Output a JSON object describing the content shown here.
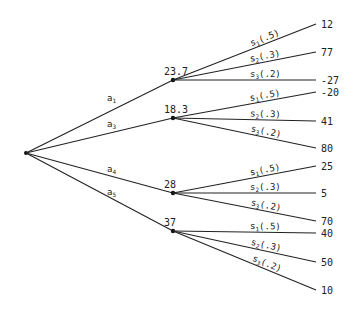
{
  "root": {
    "x": 26,
    "y": 153
  },
  "actions": [
    {
      "label": "a",
      "sub": "1",
      "value": "23.7",
      "node": {
        "x": 173,
        "y": 80
      },
      "label_pos": {
        "x": 107,
        "y": 101
      },
      "outcomes": [
        {
          "state": "s",
          "sub": "1",
          "prob": "(.5)",
          "payoff": "12",
          "y": 24
        },
        {
          "state": "s",
          "sub": "2",
          "prob": "(.3)",
          "payoff": "77",
          "y": 52
        },
        {
          "state": "s",
          "sub": "3",
          "prob": "(.2)",
          "payoff": "-27",
          "y": 80
        }
      ]
    },
    {
      "label": "a",
      "sub": "3",
      "value": "18.3",
      "node": {
        "x": 173,
        "y": 118
      },
      "label_pos": {
        "x": 107,
        "y": 127
      },
      "outcomes": [
        {
          "state": "s",
          "sub": "1",
          "prob": "(.5)",
          "payoff": "-20",
          "y": 92
        },
        {
          "state": "s",
          "sub": "2",
          "prob": "(.3)",
          "payoff": "41",
          "y": 121
        },
        {
          "state": "s",
          "sub": "3",
          "prob": "(.2)",
          "payoff": "80",
          "y": 148
        }
      ]
    },
    {
      "label": "a",
      "sub": "4",
      "value": "28",
      "node": {
        "x": 173,
        "y": 193
      },
      "label_pos": {
        "x": 107,
        "y": 172
      },
      "outcomes": [
        {
          "state": "s",
          "sub": "1",
          "prob": "(.5)",
          "payoff": "25",
          "y": 166
        },
        {
          "state": "s",
          "sub": "2",
          "prob": "(.3)",
          "payoff": "5",
          "y": 193
        },
        {
          "state": "s",
          "sub": "3",
          "prob": "(.2)",
          "payoff": "70",
          "y": 221
        }
      ]
    },
    {
      "label": "a",
      "sub": "5",
      "value": "37",
      "node": {
        "x": 173,
        "y": 231
      },
      "label_pos": {
        "x": 107,
        "y": 195
      },
      "outcomes": [
        {
          "state": "s",
          "sub": "1",
          "prob": "(.5)",
          "payoff": "40",
          "y": 233
        },
        {
          "state": "s",
          "sub": "2",
          "prob": "(.3)",
          "payoff": "50",
          "y": 262
        },
        {
          "state": "s",
          "sub": "3",
          "prob": "(.2)",
          "payoff": "10",
          "y": 290
        }
      ]
    }
  ],
  "leaf_x": 316,
  "payoff_x": 321
}
